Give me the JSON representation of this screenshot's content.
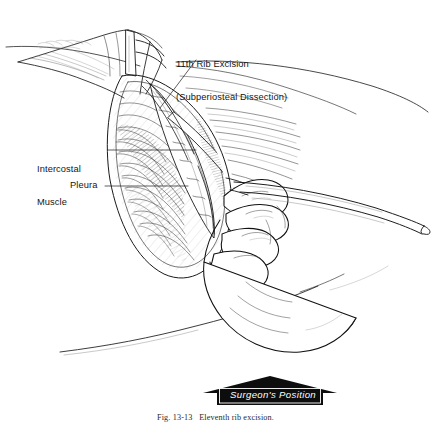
{
  "figure": {
    "title": "11th Rib Excision (Subperiosteal Dissection)",
    "caption": "Fig. 13-13   Eleventh rib excision.",
    "background_color": "#ffffff",
    "ink_color": "#1a1a1a",
    "medium": "pen-and-ink line drawing",
    "width": 431,
    "height": 423
  },
  "labels": {
    "rib_excision": {
      "line1": "11th Rib Excision",
      "line2": "(Subperiosteal Dissection)"
    },
    "intercostal_muscle": {
      "line1": "Intercostal",
      "line2": "Muscle"
    },
    "pleura": {
      "text": "Pleura"
    }
  },
  "banner": {
    "text": "Surgeon's Position",
    "fill_color": "#0d0d0d",
    "text_color": "#ffffff"
  },
  "anatomy": [
    {
      "name": "eleventh-rib",
      "description": "rib being excised subperiosteally"
    },
    {
      "name": "intercostal-muscle",
      "description": "muscle layer between ribs"
    },
    {
      "name": "pleura",
      "description": "membrane lining the thoracic cavity"
    },
    {
      "name": "skin-incision-edge",
      "description": "retracted skin and subcutaneous margin"
    },
    {
      "name": "surgical-drape",
      "description": "drape covering the flank"
    }
  ],
  "instruments": [
    {
      "name": "periosteal-elevator",
      "description": "long elevator held by surgeon entering wound from right"
    },
    {
      "name": "retractor",
      "description": "retractor holding wound edges open at upper left"
    }
  ],
  "figures": [
    {
      "name": "surgeon-hand",
      "description": "gloved right hand gripping the elevator"
    }
  ]
}
